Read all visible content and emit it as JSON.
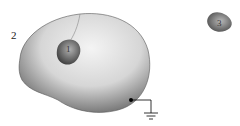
{
  "diagram": {
    "labels": {
      "conductor_1": "1",
      "conductor_2": "2",
      "conductor_3": "3"
    },
    "ground_symbol": "ground-icon"
  }
}
